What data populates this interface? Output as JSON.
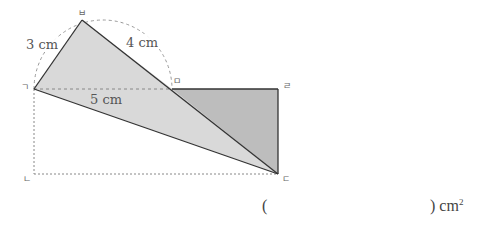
{
  "diagram": {
    "vertices": {
      "g": {
        "label": "ㄱ",
        "x": 34,
        "y": 89
      },
      "n": {
        "label": "ㄴ",
        "x": 34,
        "y": 174
      },
      "d": {
        "label": "ㄷ",
        "x": 278,
        "y": 174
      },
      "r": {
        "label": "ㄹ",
        "x": 278,
        "y": 89
      },
      "m": {
        "label": "ㅁ",
        "x": 172,
        "y": 89
      },
      "b": {
        "label": "ㅂ",
        "x": 82,
        "y": 20
      }
    },
    "measurements": {
      "gb": "3 cm",
      "bm": "4 cm",
      "gm": "5 cm"
    },
    "colors": {
      "light_fill": "#d9d9d9",
      "dark_fill": "#bdbdbd",
      "stroke": "#333333",
      "dash": "#888888"
    }
  },
  "answer": {
    "open_paren": "(",
    "close_paren": ")",
    "unit": "cm",
    "unit_exp": "2"
  }
}
